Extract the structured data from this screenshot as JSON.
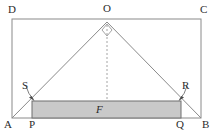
{
  "figure": {
    "type": "geometry-diagram",
    "colors": {
      "stroke": "#8a8a8a",
      "shaded_fill": "#c9c9c9",
      "shaded_stroke": "#6f6f6f",
      "label_text": "#2b2b2b",
      "background": "#ffffff"
    },
    "labels": [
      {
        "id": "D",
        "text": "D",
        "x": 8,
        "y": 4,
        "italic": false,
        "anchor": "outer-top-left"
      },
      {
        "id": "O",
        "text": "O",
        "x": 103,
        "y": 3,
        "italic": false,
        "anchor": "apex-top"
      },
      {
        "id": "C",
        "text": "C",
        "x": 200,
        "y": 4,
        "italic": false,
        "anchor": "outer-top-right"
      },
      {
        "id": "S",
        "text": "S",
        "x": 22,
        "y": 80,
        "italic": false,
        "anchor": "leader-left"
      },
      {
        "id": "R",
        "text": "R",
        "x": 182,
        "y": 80,
        "italic": false,
        "anchor": "leader-right"
      },
      {
        "id": "A",
        "text": "A",
        "x": 4,
        "y": 119,
        "italic": false,
        "anchor": "baseline-left"
      },
      {
        "id": "P",
        "text": "P",
        "x": 29,
        "y": 119,
        "italic": false,
        "anchor": "baseline"
      },
      {
        "id": "F",
        "text": "F",
        "x": 96,
        "y": 104,
        "italic": true,
        "anchor": "center-inside-shaded"
      },
      {
        "id": "Q",
        "text": "Q",
        "x": 176,
        "y": 119,
        "italic": false,
        "anchor": "baseline"
      },
      {
        "id": "B",
        "text": "B",
        "x": 202,
        "y": 119,
        "italic": false,
        "anchor": "baseline-right"
      }
    ],
    "outer_rectangle": {
      "name": "ABCD",
      "left": 12,
      "top": 19,
      "right": 201,
      "bottom": 118
    },
    "triangle": {
      "name": "AOB",
      "apex": {
        "x": 107,
        "y": 22
      },
      "left_base": {
        "x": 12,
        "y": 118
      },
      "right_base": {
        "x": 201,
        "y": 118
      }
    },
    "right_angle_marker": {
      "at": "O",
      "shape": "diamond",
      "size": 7
    },
    "center_dashed_line": {
      "from": {
        "x": 107,
        "y": 22
      },
      "to": {
        "x": 107,
        "y": 118
      },
      "dash": "2,2"
    },
    "shaded_rectangle": {
      "name": "PQRS",
      "left": 32,
      "top": 101,
      "right": 181,
      "bottom": 118
    },
    "leaders": [
      {
        "id": "S-leader",
        "from": {
          "x": 27,
          "y": 87
        },
        "to": {
          "x": 34,
          "y": 100
        }
      },
      {
        "id": "R-leader",
        "from": {
          "x": 186,
          "y": 87
        },
        "to": {
          "x": 179,
          "y": 100
        }
      }
    ]
  }
}
